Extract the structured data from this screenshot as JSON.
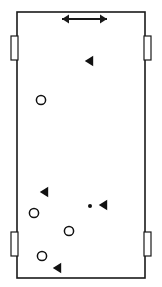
{
  "diagram": {
    "type": "court-schematic",
    "canvas": {
      "width": 162,
      "height": 287
    },
    "background_color": "#ffffff",
    "stroke_color": "#1a1a1a",
    "court": {
      "label": "court-boundary",
      "x": 17,
      "y": 12,
      "width": 128,
      "height": 266,
      "stroke_width": 1.6,
      "fill": "#ffffff"
    },
    "side_brackets": [
      {
        "label": "bracket-left-upper",
        "side": "left",
        "x": 11,
        "y": 36,
        "width": 7,
        "height": 24
      },
      {
        "label": "bracket-right-upper",
        "side": "right",
        "x": 144,
        "y": 36,
        "width": 7,
        "height": 24
      },
      {
        "label": "bracket-left-lower",
        "side": "left",
        "x": 11,
        "y": 232,
        "width": 7,
        "height": 24
      },
      {
        "label": "bracket-right-lower",
        "side": "right",
        "x": 144,
        "y": 232,
        "width": 7,
        "height": 24
      }
    ],
    "arrow": {
      "label": "double-headed-arrow",
      "x1": 62,
      "x2": 107,
      "y": 19,
      "stroke_width": 2,
      "head_length": 7,
      "head_half_width": 4.5
    },
    "markers": {
      "triangle_color": "#111111",
      "circle_color": "#111111",
      "dot_color": "#111111",
      "triangle_half_height": 5.2,
      "triangle_width": 8.4,
      "circle_radius": 4.6,
      "circle_stroke_width": 1.5,
      "dot_radius": 2.0
    },
    "triangles": [
      {
        "label": "triangle-1",
        "cx": 89,
        "cy": 61,
        "direction": "left"
      },
      {
        "label": "triangle-2",
        "cx": 44,
        "cy": 192,
        "direction": "left"
      },
      {
        "label": "triangle-3",
        "cx": 103,
        "cy": 205,
        "direction": "left"
      },
      {
        "label": "triangle-4",
        "cx": 57,
        "cy": 268,
        "direction": "left"
      }
    ],
    "circles": [
      {
        "label": "circle-1",
        "cx": 41,
        "cy": 100
      },
      {
        "label": "circle-2",
        "cx": 34,
        "cy": 213
      },
      {
        "label": "circle-3",
        "cx": 69,
        "cy": 231
      },
      {
        "label": "circle-4",
        "cx": 42,
        "cy": 256
      }
    ],
    "dots": [
      {
        "label": "dot-1",
        "cx": 90,
        "cy": 206
      }
    ]
  }
}
